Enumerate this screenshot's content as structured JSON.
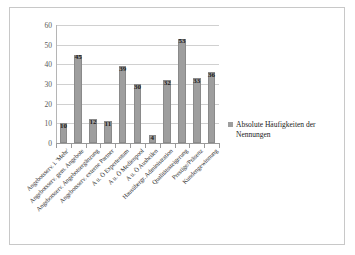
{
  "chart_data": {
    "type": "bar",
    "title": "",
    "subtitle": "",
    "xlabel": "",
    "ylabel": "",
    "ylim": [
      0,
      60
    ],
    "ytick_step": 10,
    "yticks": [
      60,
      50,
      40,
      30,
      20,
      10,
      0
    ],
    "grid": true,
    "legend_position": "right",
    "series": [
      {
        "name": "Absolute Häufigkeiten der Nennungen",
        "color": "#9e9e9e",
        "values": [
          10,
          45,
          12,
          11,
          39,
          30,
          4,
          32,
          53,
          33,
          36
        ]
      }
    ],
    "categories": [
      "Angebotsserv. i. 'Mehr'",
      "Angebotsserv. gem. Angebote",
      "Angebotsserv. Angebotsergänzung",
      "Angebotsserv. externe Partner",
      "A u. Ö Expertentum",
      "A u. Ö Medienpool",
      "A u. Ö Ausheilen",
      "Hausübergr. Administration",
      "Qualitätssteigerung",
      "Prestige/Präsenz",
      "Kundengewinnung"
    ],
    "data_labels": [
      "10",
      "45",
      "12",
      "11",
      "39",
      "30",
      "4",
      "32",
      "53",
      "33",
      "36"
    ]
  },
  "legend": {
    "entries": [
      {
        "label": "Absolute Häufigkeiten der Nennungen",
        "color": "#9e9e9e"
      }
    ]
  },
  "colors": {
    "bar": "#9e9e9e",
    "bar_border": "#8a8a8a",
    "grid": "#d0d0d0",
    "axis": "#9a9a9a",
    "frame": "#c8c8c8",
    "tick_text": "#595959",
    "label_text": "#2b2b2b"
  }
}
